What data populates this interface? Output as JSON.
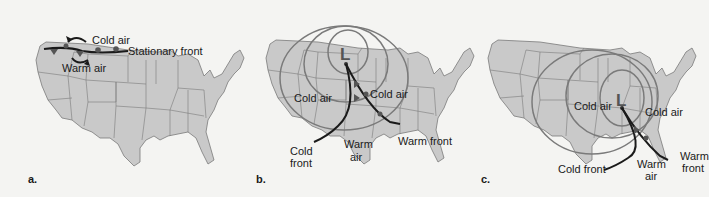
{
  "panels": [
    {
      "id": "a",
      "label": "a.",
      "annotations": {
        "cold_air": "Cold air",
        "warm_air": "Warm air",
        "front": "Stationary front"
      }
    },
    {
      "id": "b",
      "label": "b.",
      "low_symbol": "L",
      "annotations": {
        "cold_air_west": "Cold air",
        "cold_air_east": "Cold air",
        "warm_air_line1": "Warm",
        "warm_air_line2": "air",
        "cold_front_line1": "Cold",
        "cold_front_line2": "front",
        "warm_front": "Warm front"
      }
    },
    {
      "id": "c",
      "label": "c.",
      "low_symbol": "L",
      "annotations": {
        "cold_air_west": "Cold air",
        "cold_air_east": "Cold air",
        "warm_air_line1": "Warm",
        "warm_air_line2": "air",
        "cold_front": "Cold front",
        "warm_front_line1": "Warm",
        "warm_front_line2": "front"
      }
    }
  ],
  "colors": {
    "land": "#c9c9c9",
    "border": "#6e6e6e",
    "isobar": "#7a7a7a",
    "front": "#1a1a1a",
    "background": "#f4f4f2"
  }
}
